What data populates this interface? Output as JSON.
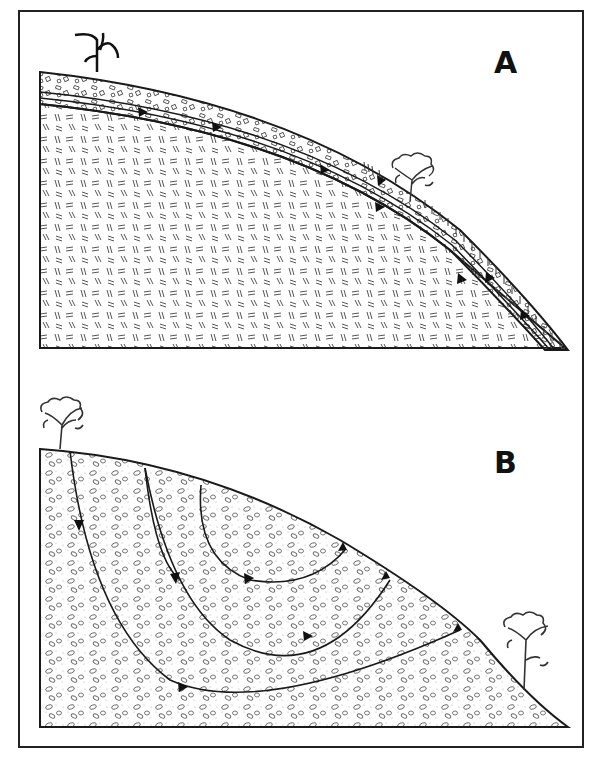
{
  "figure": {
    "panels": [
      {
        "id": "A",
        "label": "A",
        "description": "Thin permeable soil layer over low-permeability bedrock on a hillslope; subsurface flow paths run parallel to the slope within the soil and emerge at the surface downslope",
        "layers": [
          "coarse soil / regolith layer",
          "dashed-texture bedrock"
        ],
        "vegetation": [
          "grass plant at crest",
          "shrub on midslope",
          "grass tufts along lower slope"
        ],
        "flow_arrow_count": 8
      },
      {
        "id": "B",
        "label": "B",
        "description": "Deep permeable material; flow paths descend from the hill crest and curve upward to discharge on the lower slope",
        "layers": [
          "stippled pebbly deposit"
        ],
        "vegetation": [
          "shrub at crest",
          "shrub at toe of slope"
        ],
        "flow_paths": 4
      }
    ],
    "colors": {
      "ink": "#1a1a1a",
      "background": "#ffffff",
      "texture": "#555555"
    }
  }
}
